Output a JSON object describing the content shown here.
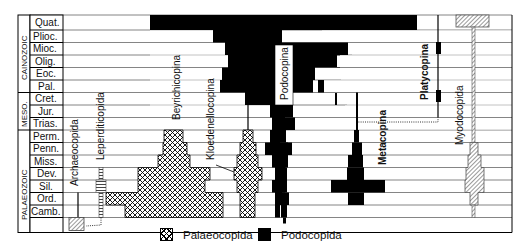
{
  "eras": [
    {
      "label": "CAINOZOIC",
      "rows": [
        0,
        5
      ]
    },
    {
      "label": "MESO.",
      "rows": [
        6,
        8
      ]
    },
    {
      "label": "PALAEOZOIC",
      "rows": [
        9,
        13
      ]
    }
  ],
  "periods": [
    "Quat.",
    "Plioc.",
    "Mioc.",
    "Olig.",
    "Eoc.",
    "Pal.",
    "Cret.",
    "Jur.",
    "Trias.",
    "Perm.",
    "Penn.",
    "Miss.",
    "Dev.",
    "Sil.",
    "Ord.",
    "Camb."
  ],
  "taxa": {
    "archaeocopida": "Archaeocopida",
    "leperditicopida": "Leperditicopida",
    "beyrichicopina": "Beyrichicopina",
    "kloedenellocopina": "Kloedenellocopina",
    "podocopina": "Podocopina",
    "metacopina": "Metacopina",
    "platycopina": "Platycopina",
    "myodocopida": "Myodocopida"
  },
  "legend": [
    {
      "pattern": "crosshatch",
      "label": "Palaeocopida"
    },
    {
      "pattern": "solid-black",
      "label": "Podocopida"
    }
  ],
  "colors": {
    "ink": "#000000",
    "paper": "#ffffff",
    "grid": "#555555"
  }
}
